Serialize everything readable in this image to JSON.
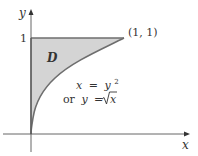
{
  "figure": {
    "axes": {
      "x_label": "x",
      "y_label": "y",
      "y_tick_label": "1"
    },
    "region": {
      "label": "D",
      "fill_color": "#d4d4d4",
      "boundary_color": "#6e6e6e"
    },
    "point_label": "(1, 1)",
    "curve": {
      "line1_lhs": "x",
      "line1_eq": "=",
      "line1_rhs_base": "y",
      "line1_rhs_exp": "2",
      "line2_prefix": "or",
      "line2_lhs": "y",
      "line2_eq": "=",
      "line2_rhs": "x"
    }
  }
}
